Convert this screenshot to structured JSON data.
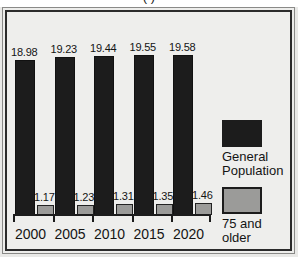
{
  "chart_data": {
    "type": "bar",
    "title": "( )",
    "xlabel": "",
    "ylabel": "",
    "categories": [
      "2000",
      "2005",
      "2010",
      "2015",
      "2020"
    ],
    "series": [
      {
        "name": "General Population",
        "color": "#1c1c1c",
        "values": [
          18.98,
          19.23,
          19.44,
          19.55,
          19.58
        ],
        "labels": [
          "18.98",
          "19.23",
          "19.44",
          "19.55",
          "19.58"
        ]
      },
      {
        "name": "75 and older",
        "color": "#9b9b99",
        "values": [
          1.17,
          1.23,
          1.31,
          1.35,
          1.46
        ],
        "labels": [
          "1.17",
          "1.23",
          "1.31",
          "1.35",
          "1.46"
        ]
      }
    ],
    "ylim": [
      0,
      21
    ],
    "grid": false,
    "legend_position": "right"
  },
  "legend": {
    "entries": [
      {
        "label": "General\nPopulation",
        "swatch": "#1c1c1c"
      },
      {
        "label": "75 and\nolder",
        "swatch": "#9b9b99"
      }
    ]
  },
  "axis": {
    "ticks": [
      "2000",
      "2005",
      "2010",
      "2015",
      "2020"
    ]
  }
}
